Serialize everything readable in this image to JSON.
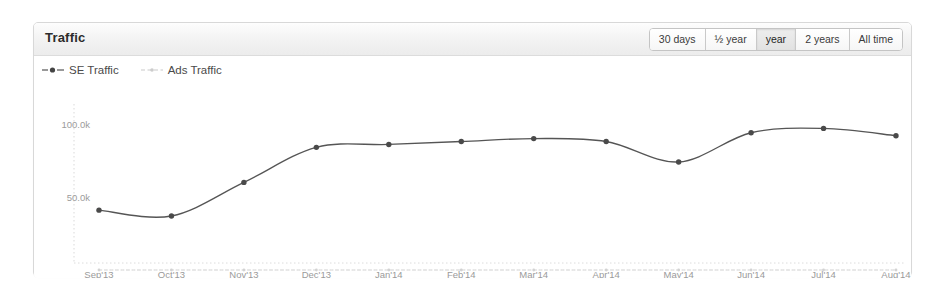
{
  "panel": {
    "title": "Traffic"
  },
  "range_selector": {
    "options": [
      {
        "label": "30 days",
        "active": false
      },
      {
        "label": "½ year",
        "active": false
      },
      {
        "label": "year",
        "active": true
      },
      {
        "label": "2 years",
        "active": false
      },
      {
        "label": "All time",
        "active": false
      }
    ]
  },
  "legend": {
    "entries": [
      {
        "label": "SE Traffic",
        "icon": "solid-line-dot-marker",
        "color": "#555555"
      },
      {
        "label": "Ads Traffic",
        "icon": "dashed-line-marker",
        "color": "#c9c9c9"
      }
    ]
  },
  "chart_data": {
    "type": "line",
    "title": "Traffic",
    "xlabel": "",
    "ylabel": "",
    "grid": false,
    "legend_position": "top-left",
    "x": [
      "Sep'13",
      "Oct'13",
      "Nov'13",
      "Dec'13",
      "Jan'14",
      "Feb'14",
      "Mar'14",
      "Apr'14",
      "May'14",
      "Jun'14",
      "Jul'14",
      "Aug'14"
    ],
    "categories": [
      "Sep'13",
      "Oct'13",
      "Nov'13",
      "Dec'13",
      "Jan'14",
      "Feb'14",
      "Mar'14",
      "Apr'14",
      "May'14",
      "Jun'14",
      "Jul'14",
      "Aug'14"
    ],
    "ytick_labels": [
      "100.0k",
      "50.0k"
    ],
    "ytick_values": [
      100000,
      50000
    ],
    "ylim": [
      0,
      115000
    ],
    "series": [
      {
        "name": "SE Traffic",
        "color": "#555555",
        "style": "solid",
        "markers": true,
        "values": [
          41000,
          37000,
          60000,
          84000,
          86000,
          88000,
          90000,
          88000,
          74000,
          94000,
          97000,
          92000
        ]
      },
      {
        "name": "Ads Traffic",
        "color": "#cfcfcf",
        "style": "dashed",
        "markers": true,
        "values": [
          0,
          0,
          0,
          0,
          0,
          0,
          0,
          0,
          0,
          0,
          0,
          0
        ]
      }
    ]
  }
}
